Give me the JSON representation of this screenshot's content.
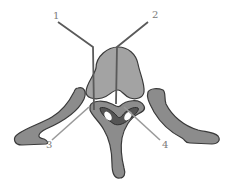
{
  "diagram": {
    "colors": {
      "bone_fill": "#8c8c8c",
      "bone_fill_light": "#a3a3a3",
      "bone_outline": "#3a3a3a",
      "foramen_fill": "#555555",
      "leader_line_dark": "#5a5a5a",
      "leader_line_light": "#9a9a9a",
      "label_text": "#7a7a7a",
      "background": "#ffffff"
    },
    "labels": [
      {
        "id": "1",
        "text": "1",
        "x": 53,
        "y": 11
      },
      {
        "id": "2",
        "text": "2",
        "x": 152,
        "y": 10
      },
      {
        "id": "3",
        "text": "3",
        "x": 46,
        "y": 140
      },
      {
        "id": "4",
        "text": "4",
        "x": 162,
        "y": 140
      }
    ],
    "structures": [
      {
        "name": "vertebral-body"
      },
      {
        "name": "left-transverse-process"
      },
      {
        "name": "right-transverse-process"
      },
      {
        "name": "vertebral-arch"
      },
      {
        "name": "vertebral-foramen"
      },
      {
        "name": "spinous-process"
      }
    ]
  }
}
